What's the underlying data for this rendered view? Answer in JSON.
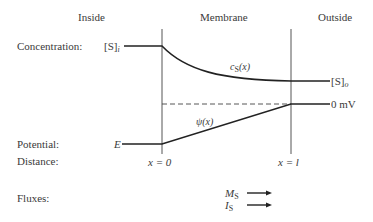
{
  "headers": {
    "inside": "Inside",
    "membrane": "Membrane",
    "outside": "Outside"
  },
  "row_labels": {
    "concentration": "Concentration:",
    "potential": "Potential:",
    "distance": "Distance:",
    "fluxes": "Fluxes:"
  },
  "concentration": {
    "inside_label": "[S]",
    "inside_sub": "i",
    "outside_label": "[S]",
    "outside_sub": "o",
    "curve_label": "c",
    "curve_sub": "S",
    "curve_arg": "(x)"
  },
  "potential": {
    "inside_label": "E",
    "outside_label": "0 mV",
    "curve_label": "ψ(x)"
  },
  "distance": {
    "left_boundary": "x = 0",
    "right_boundary": "x = l"
  },
  "fluxes": {
    "mass_flux_label": "M",
    "mass_flux_sub": "S",
    "current_label": "I",
    "current_sub": "S"
  },
  "colors": {
    "line": "#222222",
    "membrane_line": "#555555",
    "text": "#3a3a3a"
  }
}
